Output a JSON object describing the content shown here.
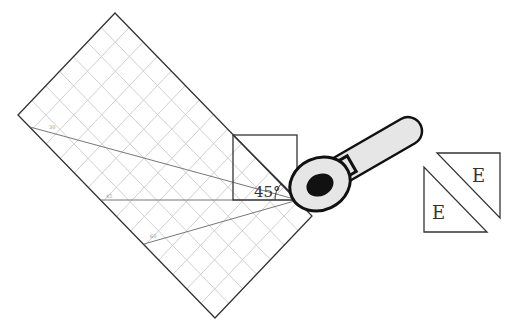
{
  "diagram": {
    "angle_label": "45°",
    "line_labels": [
      "30",
      "45",
      "60"
    ],
    "triangle_labels": [
      "E",
      "E"
    ],
    "colors": {
      "stroke": "#333333",
      "grid": "#c8c8c8",
      "ray": "#777777",
      "tool_body": "#e6e6e6",
      "tool_dark": "#111111"
    }
  }
}
